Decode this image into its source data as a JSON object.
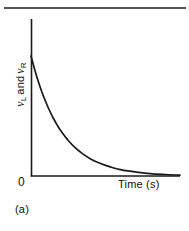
{
  "figure": {
    "caption": "(a)",
    "background_color": "#ffffff",
    "rule_color": "#56565a",
    "ink_color": "#111111",
    "curve_color": "#1a1a1a"
  },
  "axes": {
    "y_label_var_1": "v",
    "y_label_sub_1": "L",
    "y_label_conjunction": "and",
    "y_label_var_2": "v",
    "y_label_sub_2": "R",
    "y_label_full": "v_L and v_R",
    "x_label": "Time (s)",
    "origin_label": "0"
  },
  "chart_data": {
    "type": "line",
    "title": "",
    "subtitle": "",
    "xlabel": "Time (s)",
    "ylabel": "v_L and v_R",
    "grid": false,
    "legend": null,
    "annotations": [
      "(a)"
    ],
    "xlim": [
      0,
      10
    ],
    "ylim": [
      0,
      10
    ],
    "axis_ticks": {
      "x": [
        "0"
      ],
      "y": [
        "0"
      ]
    },
    "series": [
      {
        "name": "v_L and v_R",
        "description": "exponential decay, v = V0 * exp(-t/tau)",
        "x": [
          0.0,
          0.25,
          0.5,
          0.75,
          1.0,
          1.25,
          1.5,
          1.75,
          2.0,
          2.5,
          3.0,
          3.5,
          4.0,
          4.5,
          5.0,
          5.5,
          6.0,
          6.5,
          7.0,
          8.0,
          9.0,
          10.0
        ],
        "y": [
          8.0,
          7.08,
          6.27,
          5.55,
          4.92,
          4.35,
          3.85,
          3.41,
          3.02,
          2.37,
          1.86,
          1.46,
          1.14,
          0.9,
          0.71,
          0.55,
          0.43,
          0.34,
          0.27,
          0.16,
          0.1,
          0.06
        ]
      }
    ]
  },
  "geometry": {
    "axis_x_origin": 31,
    "axis_y_origin": 176,
    "axis_y_top": 19,
    "axis_x_right": 180,
    "curve_start_y": 56
  }
}
